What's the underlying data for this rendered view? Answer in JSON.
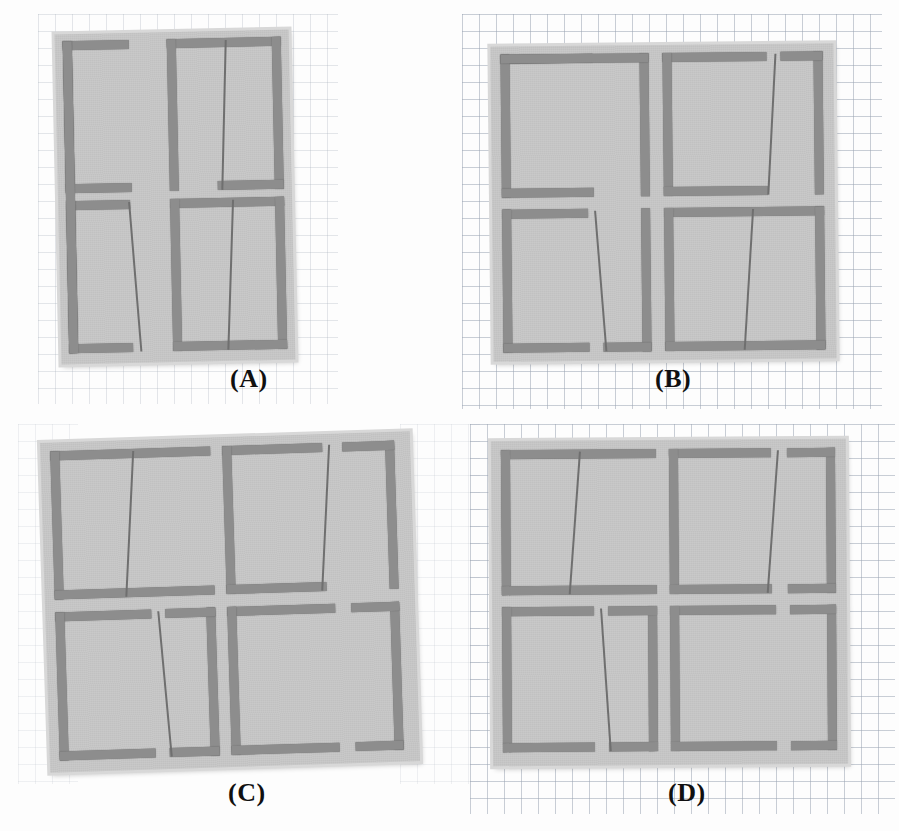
{
  "figure": {
    "kind": "photograph-composite",
    "background": "graph paper (millimeter grid)",
    "panel_count": 4,
    "colors": {
      "page": "#ffffff",
      "grid_line": "#96a0af",
      "substrate": "#c9c9c9",
      "substrate_edge": "#d8d8d8",
      "metal_trace": "#8d8d8d",
      "hairline_slot": "#6f6f6f",
      "caption_text": "#101010"
    }
  },
  "panels": [
    {
      "id": "A",
      "caption": "(A)",
      "caption_x": 230,
      "caption_y": 364,
      "x": 58,
      "y": 32,
      "w": 233,
      "h": 0,
      "board": {
        "x": 58,
        "y": 32,
        "w": 234,
        "h": 330,
        "rotate": -1.2
      },
      "unit_cells": 4,
      "cell_grid": "2 x 2",
      "description": "Planar array of four split-ring unit cells on a light substrate, photographed on graph paper.",
      "cells": [
        {
          "row": 0,
          "col": 0,
          "top_gap": "right",
          "bottom_gap": "right",
          "hairline": "none",
          "skew": 0
        },
        {
          "row": 0,
          "col": 1,
          "top_gap": "right",
          "bottom_gap": "right",
          "hairline": "right",
          "skew": 3
        },
        {
          "row": 1,
          "col": 0,
          "top_gap": "left",
          "bottom_gap": "left",
          "hairline": "right",
          "skew": -4
        },
        {
          "row": 1,
          "col": 1,
          "top_gap": "none",
          "bottom_gap": "none",
          "hairline": "right",
          "skew": 4
        }
      ]
    },
    {
      "id": "B",
      "caption": "(B)",
      "caption_x": 655,
      "caption_y": 364,
      "board": {
        "x": 492,
        "y": 45,
        "w": 343,
        "h": 315,
        "rotate": -0.6
      },
      "unit_cells": 4,
      "cell_grid": "2 x 2",
      "description": "Second fabricated prototype; split-ring cells with shifted gap positions.",
      "cells": [
        {
          "row": 0,
          "col": 0,
          "top_gap": "right",
          "bottom_gap": "right",
          "hairline": "none",
          "skew": 0
        },
        {
          "row": 0,
          "col": 1,
          "top_gap": "right",
          "bottom_gap": "right",
          "hairline": "right",
          "skew": 4
        },
        {
          "row": 1,
          "col": 0,
          "top_gap": "right",
          "bottom_gap": "right",
          "hairline": "right",
          "skew": -5
        },
        {
          "row": 1,
          "col": 1,
          "top_gap": "none",
          "bottom_gap": "none",
          "hairline": "right",
          "skew": 5
        }
      ]
    },
    {
      "id": "C",
      "caption": "(C)",
      "caption_x": 228,
      "caption_y": 778,
      "board": {
        "x": 45,
        "y": 437,
        "w": 370,
        "h": 330,
        "rotate": -1.8
      },
      "unit_cells": 4,
      "cell_grid": "2 x 2",
      "description": "Third fabricated prototype; rings tilted, gaps on alternating sides.",
      "cells": [
        {
          "row": 0,
          "col": 0,
          "top_gap": "none",
          "bottom_gap": "none",
          "hairline": "right",
          "skew": 5
        },
        {
          "row": 0,
          "col": 1,
          "top_gap": "left",
          "bottom_gap": "right",
          "hairline": "right",
          "skew": 5
        },
        {
          "row": 1,
          "col": 0,
          "top_gap": "right",
          "bottom_gap": "right",
          "hairline": "right",
          "skew": -4
        },
        {
          "row": 1,
          "col": 1,
          "top_gap": "left",
          "bottom_gap": "left",
          "hairline": "none",
          "skew": 0
        }
      ]
    },
    {
      "id": "D",
      "caption": "(D)",
      "caption_x": 668,
      "caption_y": 778,
      "board": {
        "x": 492,
        "y": 440,
        "w": 355,
        "h": 325,
        "rotate": -0.4
      },
      "unit_cells": 4,
      "cell_grid": "2 x 2",
      "description": "Fourth fabricated prototype; widest substrate, rings with mirrored gap placement.",
      "cells": [
        {
          "row": 0,
          "col": 0,
          "top_gap": "none",
          "bottom_gap": "none",
          "hairline": "right",
          "skew": 5
        },
        {
          "row": 0,
          "col": 1,
          "top_gap": "right",
          "bottom_gap": "right",
          "hairline": "right",
          "skew": 5
        },
        {
          "row": 1,
          "col": 0,
          "top_gap": "right",
          "bottom_gap": "right",
          "hairline": "right",
          "skew": -4
        },
        {
          "row": 1,
          "col": 1,
          "top_gap": "left",
          "bottom_gap": "left",
          "hairline": "none",
          "skew": 0
        }
      ]
    }
  ]
}
